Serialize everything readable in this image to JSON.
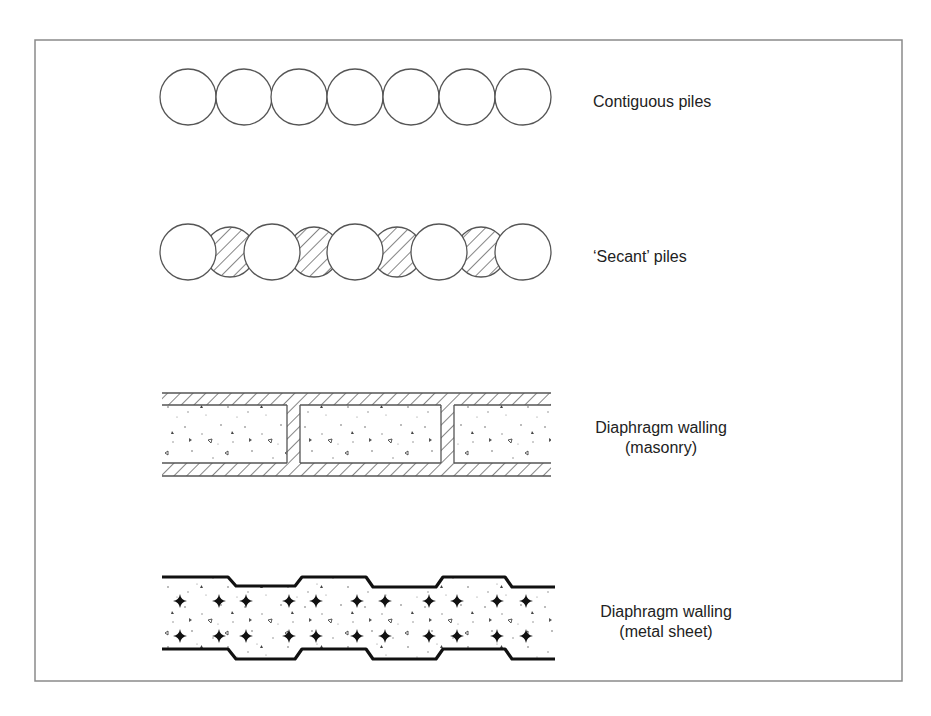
{
  "figure": {
    "frame": {
      "x": 35,
      "y": 40,
      "width": 867,
      "height": 641,
      "stroke": "#8a8a8a"
    },
    "line_color": "#555555",
    "wall_types": [
      {
        "id": "contiguous",
        "label": "Contiguous piles",
        "label_lines": [
          "Contiguous piles"
        ],
        "label_x": 593,
        "label_y": 92,
        "align": "left"
      },
      {
        "id": "secant",
        "label": "'Secant' piles",
        "label_lines": [
          "‘Secant’ piles"
        ],
        "label_x": 593,
        "label_y": 247,
        "align": "left"
      },
      {
        "id": "masonry",
        "label": "Diaphragm walling (masonry)",
        "label_lines": [
          "Diaphragm walling",
          "(masonry)"
        ],
        "label_cx": 661,
        "label_y": 418,
        "align": "center"
      },
      {
        "id": "metal",
        "label": "Diaphragm walling (metal sheet)",
        "label_lines": [
          "Diaphragm walling",
          "(metal sheet)"
        ],
        "label_cx": 666,
        "label_y": 602,
        "align": "center"
      }
    ],
    "contiguous_piles": {
      "cy": 97,
      "r": 28,
      "cx": [
        188,
        244,
        299,
        355,
        411,
        467,
        523
      ]
    },
    "secant_piles": {
      "cy": 252,
      "primary_r": 28,
      "primary_cx": [
        188,
        272,
        355,
        439,
        523
      ],
      "secondary_r": 25,
      "secondary_cx": [
        230,
        314,
        397,
        481
      ]
    },
    "masonry_wall": {
      "x0": 162,
      "x1": 551,
      "top_band": [
        393,
        405
      ],
      "bottom_band": [
        463,
        476
      ],
      "cross_walls": [
        [
          287,
          300
        ],
        [
          441,
          454
        ]
      ]
    },
    "metal_wall": {
      "top_path": [
        [
          162,
          577
        ],
        [
          228,
          577
        ],
        [
          236,
          586
        ],
        [
          295,
          586
        ],
        [
          302,
          577
        ],
        [
          366,
          577
        ],
        [
          373,
          587
        ],
        [
          436,
          587
        ],
        [
          443,
          577
        ],
        [
          505,
          577
        ],
        [
          512,
          587
        ],
        [
          555,
          587
        ]
      ],
      "bottom_path": [
        [
          162,
          649
        ],
        [
          228,
          649
        ],
        [
          236,
          659
        ],
        [
          295,
          659
        ],
        [
          302,
          649
        ],
        [
          366,
          649
        ],
        [
          373,
          659
        ],
        [
          436,
          659
        ],
        [
          443,
          649
        ],
        [
          505,
          649
        ],
        [
          512,
          659
        ],
        [
          555,
          659
        ]
      ],
      "stud_rows_y": [
        601,
        636
      ],
      "stud_x": [
        180,
        219,
        246,
        289,
        316,
        357,
        385,
        429,
        457,
        497,
        526
      ]
    }
  }
}
